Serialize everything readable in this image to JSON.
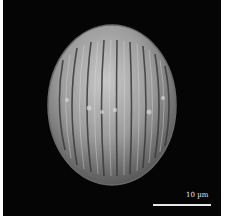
{
  "image": {
    "subject": "SEM micrograph of a pollen grain",
    "background_color": "#050505",
    "grain_color": "#9a9a9a"
  },
  "scale_bar": {
    "label": "10 µm"
  }
}
